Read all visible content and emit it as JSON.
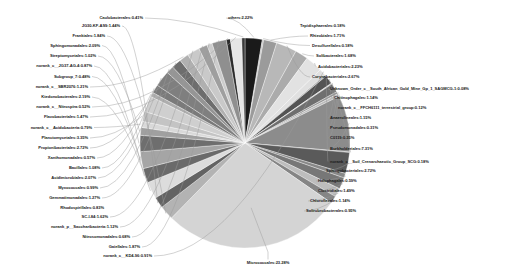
{
  "chart_data": {
    "type": "pie",
    "title": "",
    "subtitle": "",
    "xlabel": "",
    "ylabel": "",
    "legend_position": "none",
    "grid": false,
    "units": "percent",
    "start_angle_deg": -90,
    "direction": "clockwise",
    "categories": [
      "Micrococcales",
      "Burkholderiales",
      "Corynebacteriales",
      "Sphingobacteriales",
      "Acidobacteriales",
      "others",
      "Subgroup_7",
      "Sphingomonadales",
      "Propionibacteriales",
      "Acidimicrobiales",
      "Rhizobiales",
      "Planctomycetales",
      "norank_c__JG37-AG-4",
      "Solibacterales",
      "Ktedonobacterales",
      "Gaiellales",
      "Frankiales",
      "JG30-KF-AS9",
      "Flavobacteriales",
      "Streptomycetales",
      "Clostridiales",
      "SC-I-84",
      "Myxococcales",
      "Chitinophagales",
      "Chloroflexales",
      "Solirubrobacterales",
      "norank_c__Acidobacteria",
      "Anaerolineales",
      "Xanthomonadales",
      "Nitrosomonadales",
      "Bacillales",
      "norank_p__Saccharibacteria",
      "norank_c__KD4-96",
      "norank_c__Nitrospira",
      "norank_c__SBR2076",
      "Halophagales",
      "Desulfurellales",
      "Gemmatimonadales",
      "norank_c__FFCH6111_terrestrial_group",
      "Pseudomonadales",
      "Caulobacterales",
      "C0119",
      "norank_c__Soil_Crenarchaeotic_Group_SCG",
      "Unknown_Order_c__South_African_Gold_Mine_Gp_1_SAGMCG-1"
    ],
    "values": [
      23.28,
      7.31,
      2.67,
      2.72,
      2.23,
      2.22,
      2.19,
      2.09,
      2.05,
      2.07,
      1.71,
      1.29,
      1.87,
      1.68,
      2.19,
      1.87,
      1.84,
      1.44,
      1.47,
      1.02,
      1.49,
      1.62,
      0.99,
      1.14,
      1.14,
      0.95,
      0.79,
      1.15,
      0.57,
      0.68,
      1.08,
      1.12,
      0.91,
      0.52,
      1.21,
      0.59,
      0.18,
      1.27,
      0.12,
      0.31,
      0.41,
      0.35,
      0.18,
      0.08
    ],
    "slice_colors": [
      "#d4d4d4",
      "#8c8c8c",
      "#b8b8b8",
      "#5a5a5a",
      "#e2e2e2",
      "#1a1a1a",
      "#a5a5a5",
      "#6e6e6e",
      "#cfcfcf",
      "#7f7f7f",
      "#9b9b9b",
      "#c4c4c4",
      "#6a6a6a",
      "#ababab",
      "#dcdcdc",
      "#8f8f8f",
      "#b3b3b3",
      "#636363",
      "#e6e6e6",
      "#a0a0a0",
      "#777777",
      "#c9c9c9",
      "#959595",
      "#545454",
      "#bdbdbd",
      "#858585",
      "#d9d9d9",
      "#6f6f6f",
      "#aeaeae",
      "#cccccc",
      "#7a7a7a",
      "#9f9f9f",
      "#e0e0e0",
      "#2b2b2b",
      "#b0b0b0",
      "#888888",
      "#c0c0c0",
      "#6d6d6d",
      "#d2d2d2",
      "#989898",
      "#3a3a3a",
      "#bcbcbc",
      "#aaaaaa",
      "#7e7e7e"
    ]
  },
  "labels": {
    "top_left_cluster": [
      {
        "name": "Caulobacterales",
        "percent": "0.41%",
        "text": "Caulobacterales:0.41%"
      },
      {
        "name": "JG30-KF-AS9",
        "percent": "1.44%",
        "text": "JG30-KF-AS9:1.44%"
      },
      {
        "name": "Frankiales",
        "percent": "1.84%",
        "text": "Frankiales:1.84%"
      },
      {
        "name": "Sphingomonadales",
        "percent": "2.09%",
        "text": "Sphingomonadales:2.09%"
      },
      {
        "name": "Streptomycetales",
        "percent": "1.02%",
        "text": "Streptomycetales:1.02%"
      },
      {
        "name": "norank_c__JG37-AG-4",
        "percent": "0.87%",
        "text": "norank_c__JG37-AG-4:0.87%"
      },
      {
        "name": "Subgroup_7",
        "percent": "0.48%",
        "text": "Subgroup_7:0.48%"
      },
      {
        "name": "norank_c__SBR2076",
        "percent": "1.21%",
        "text": "norank_c__SBR2076:1.21%"
      },
      {
        "name": "Ktedonobacterales",
        "percent": "2.19%",
        "text": "Ktedonobacterales:2.19%"
      },
      {
        "name": "norank_c__Nitrospira",
        "percent": "0.52%",
        "text": "norank_c__Nitrospira:0.52%"
      },
      {
        "name": "Flavobacteriales",
        "percent": "1.47%",
        "text": "Flavobacteriales:1.47%"
      },
      {
        "name": "norank_c__Acidobacteria",
        "percent": "0.79%",
        "text": "norank_c__Acidobacteria:0.79%"
      },
      {
        "name": "Planctomycetales",
        "percent": "3.35%",
        "text": "Planctomycetales:3.35%"
      },
      {
        "name": "Propionibacteriales",
        "percent": "2.72%",
        "text": "Propionibacteriales:2.72%"
      },
      {
        "name": "Xanthomonadales",
        "percent": "0.57%",
        "text": "Xanthomonadales:0.57%"
      },
      {
        "name": "Bacillales",
        "percent": "1.08%",
        "text": "Bacillales:1.08%"
      },
      {
        "name": "Acidimicrobiales",
        "percent": "2.07%",
        "text": "Acidimicrobiales:2.07%"
      },
      {
        "name": "Myxococcales",
        "percent": "0.99%",
        "text": "Myxococcales:0.99%"
      },
      {
        "name": "Gemmatimonadales",
        "percent": "1.27%",
        "text": "Gemmatimonadales:1.27%"
      },
      {
        "name": "Rhodospirillales",
        "percent": "0.83%",
        "text": "Rhodospirillales:0.83%"
      },
      {
        "name": "SC-I-84",
        "percent": "1.62%",
        "text": "SC-I-84:1.62%"
      },
      {
        "name": "norank_p__Saccharibacteria",
        "percent": "1.12%",
        "text": "norank_p__Saccharibacteria:1.12%"
      },
      {
        "name": "Nitrosomonadales",
        "percent": "0.68%",
        "text": "Nitrosomonadales:0.68%"
      },
      {
        "name": "Gaiellales",
        "percent": "1.87%",
        "text": "Gaiellales:1.87%"
      },
      {
        "name": "norank_c__KD4-96",
        "percent": "0.91%",
        "text": "norank_c__KD4-96:0.91%"
      }
    ],
    "top_right_cluster": [
      {
        "name": "others",
        "percent": "2.22%",
        "text": "others:2.22%"
      },
      {
        "name": "Tepidisphaerales",
        "percent": "0.18%",
        "text": "Tepidisphaerales:0.18%"
      },
      {
        "name": "Rhizobiales",
        "percent": "1.71%",
        "text": "Rhizobiales:1.71%"
      },
      {
        "name": "Desulfurellales",
        "percent": "0.18%",
        "text": "Desulfurellales:0.18%"
      },
      {
        "name": "Solibacterales",
        "percent": "1.68%",
        "text": "Solibacterales:1.68%"
      },
      {
        "name": "Acidobacteriales",
        "percent": "2.23%",
        "text": "Acidobacteriales:2.23%"
      },
      {
        "name": "Corynebacteriales",
        "percent": "2.67%",
        "text": "Corynebacteriales:2.67%"
      },
      {
        "name": "Unknown_Order_c__South_African_Gold_Mine_Gp_1_SAGMCG-1",
        "percent": "0.08%",
        "text": "Unknown_Order_c__South_African_Gold_Mine_Gp_1_SAGMCG-1:0.08%"
      },
      {
        "name": "Chitinophagales",
        "percent": "1.14%",
        "text": "Chitinophagales:1.14%"
      },
      {
        "name": "norank_c__FFCH6111_terrestrial_group",
        "percent": "0.12%",
        "text": "norank_c__FFCH6111_terrestrial_group:0.12%"
      },
      {
        "name": "Anaerolineales",
        "percent": "1.15%",
        "text": "Anaerolineales:1.15%"
      },
      {
        "name": "Pseudomonadales",
        "percent": "0.31%",
        "text": "Pseudomonadales:0.31%"
      },
      {
        "name": "C0119",
        "percent": "0.35%",
        "text": "C0119:0.35%"
      },
      {
        "name": "Burkholderiales",
        "percent": "7.31%",
        "text": "Burkholderiales:7.31%"
      },
      {
        "name": "norank_c__Soil_Crenarchaeotic_Group_SCG",
        "percent": "0.18%",
        "text": "norank_c__Soil_Crenarchaeotic_Group_SCG:0.18%"
      },
      {
        "name": "Sphingobacteriales",
        "percent": "2.72%",
        "text": "Sphingobacteriales:2.72%"
      },
      {
        "name": "Halophagales",
        "percent": "0.59%",
        "text": "Halophagales:0.59%"
      },
      {
        "name": "Clostridiales",
        "percent": "1.49%",
        "text": "Clostridiales:1.49%"
      },
      {
        "name": "Chloroflexales",
        "percent": "1.14%",
        "text": "Chloroflexales:1.14%"
      },
      {
        "name": "Solirubrobacterales",
        "percent": "0.95%",
        "text": "Solirubrobacterales:0.95%"
      }
    ],
    "bottom": [
      {
        "name": "Micrococcales",
        "percent": "23.28%",
        "text": "Micrococcales:23.28%"
      }
    ]
  }
}
